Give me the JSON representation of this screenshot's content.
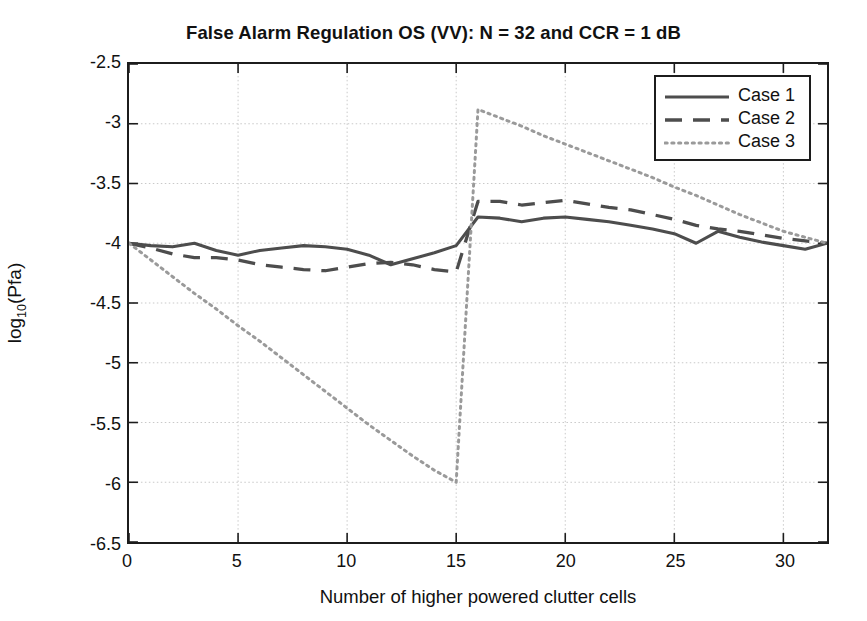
{
  "chart_data": {
    "type": "line",
    "title": "False Alarm Regulation OS (VV): N = 32 and CCR = 1 dB",
    "xlabel": "Number of higher powered clutter cells",
    "ylabel_text": "log10(Pfa)",
    "ylabel_base": "log",
    "ylabel_sub": "10",
    "ylabel_tail": "(Pfa)",
    "grid": true,
    "legend_position": "top-right",
    "xlim": [
      0,
      32
    ],
    "ylim": [
      -6.5,
      -2.5
    ],
    "xticks": [
      0,
      5,
      10,
      15,
      20,
      25,
      30
    ],
    "xtick_labels": [
      "0",
      "5",
      "10",
      "15",
      "20",
      "25",
      "30"
    ],
    "yticks": [
      -2.5,
      -3,
      -3.5,
      -4,
      -4.5,
      -5,
      -5.5,
      -6,
      -6.5
    ],
    "ytick_labels": [
      "-2.5",
      "-3",
      "-3.5",
      "-4",
      "-4.5",
      "-5",
      "-5.5",
      "-6",
      "-6.5"
    ],
    "x": [
      0,
      1,
      2,
      3,
      4,
      5,
      6,
      7,
      8,
      9,
      10,
      11,
      12,
      13,
      14,
      15,
      16,
      17,
      18,
      19,
      20,
      21,
      22,
      23,
      24,
      25,
      26,
      27,
      28,
      29,
      30,
      31,
      32
    ],
    "series": [
      {
        "name": "Case 1",
        "style": "solid",
        "color": "#4d4d4d",
        "values": [
          -4.0,
          -4.02,
          -4.03,
          -4.0,
          -4.06,
          -4.1,
          -4.06,
          -4.04,
          -4.02,
          -4.03,
          -4.05,
          -4.1,
          -4.18,
          -4.13,
          -4.08,
          -4.02,
          -3.78,
          -3.79,
          -3.82,
          -3.79,
          -3.78,
          -3.8,
          -3.82,
          -3.85,
          -3.88,
          -3.92,
          -4.0,
          -3.9,
          -3.95,
          -3.99,
          -4.02,
          -4.05,
          -4.0
        ]
      },
      {
        "name": "Case 2",
        "style": "dashed",
        "color": "#4d4d4d",
        "values": [
          -4.0,
          -4.04,
          -4.09,
          -4.12,
          -4.12,
          -4.14,
          -4.18,
          -4.2,
          -4.22,
          -4.23,
          -4.2,
          -4.17,
          -4.16,
          -4.18,
          -4.22,
          -4.24,
          -3.65,
          -3.65,
          -3.68,
          -3.66,
          -3.64,
          -3.67,
          -3.7,
          -3.72,
          -3.76,
          -3.8,
          -3.85,
          -3.88,
          -3.9,
          -3.93,
          -3.96,
          -3.98,
          -4.0
        ]
      },
      {
        "name": "Case 3",
        "style": "dotted",
        "color": "#9a9a9a",
        "values": [
          -4.0,
          -4.14,
          -4.28,
          -4.42,
          -4.55,
          -4.69,
          -4.82,
          -4.96,
          -5.1,
          -5.24,
          -5.38,
          -5.52,
          -5.65,
          -5.78,
          -5.9,
          -6.0,
          -2.88,
          -2.95,
          -3.02,
          -3.1,
          -3.17,
          -3.24,
          -3.31,
          -3.38,
          -3.45,
          -3.53,
          -3.6,
          -3.68,
          -3.76,
          -3.83,
          -3.9,
          -3.95,
          -4.0
        ]
      }
    ]
  },
  "legend": {
    "items": [
      {
        "label": "Case 1"
      },
      {
        "label": "Case 2"
      },
      {
        "label": "Case 3"
      }
    ]
  }
}
